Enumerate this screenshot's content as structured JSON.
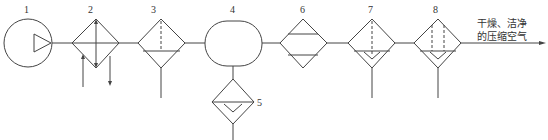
{
  "diagram": {
    "type": "pneumatic-air-source-system",
    "components": [
      {
        "id": "1",
        "label": "1",
        "symbol": "air-compressor"
      },
      {
        "id": "2",
        "label": "2",
        "symbol": "aftercooler"
      },
      {
        "id": "3",
        "label": "3",
        "symbol": "water-separator"
      },
      {
        "id": "4",
        "label": "4",
        "symbol": "air-receiver"
      },
      {
        "id": "5",
        "label": "5",
        "symbol": "drain-filter"
      },
      {
        "id": "6",
        "label": "6",
        "symbol": "dryer"
      },
      {
        "id": "7",
        "label": "7",
        "symbol": "filter"
      },
      {
        "id": "8",
        "label": "8",
        "symbol": "fine-filter"
      }
    ],
    "output_text": {
      "line1": "干燥、洁净",
      "line2": "的压缩空气"
    },
    "colors": {
      "line": "#444444",
      "text": "#333333",
      "background": "#ffffff"
    }
  }
}
